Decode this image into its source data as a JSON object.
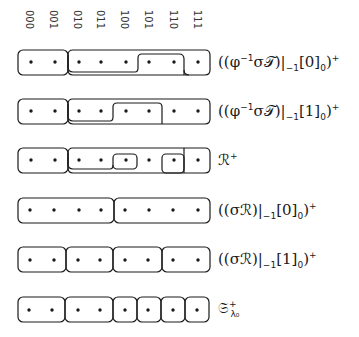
{
  "columns": [
    "000",
    "001",
    "010",
    "011",
    "100",
    "101",
    "110",
    "111"
  ],
  "rows": [
    {
      "label_main": "((φ",
      "label_sup1": "−1",
      "label_mid": "σ𝒯)|",
      "label_sub1": "−1",
      "label_bracket": "[0]",
      "label_sub2": "0",
      "label_end": ")",
      "label_sup2": "+",
      "partition": "{000,001} {010,011,100,101,110} {101,110}⊂ {111}",
      "description": "Outer blocks: [000-001], [010-110] with nested [101-110], [111]"
    },
    {
      "label_main": "((φ",
      "label_sup1": "−1",
      "label_mid": "σ𝒯)|",
      "label_sub1": "−1",
      "label_bracket": "[1]",
      "label_sub2": "0",
      "label_end": ")",
      "label_sup2": "+",
      "description": "Outer blocks: [000-001], [010-101] with nested [100-101], [110-111]"
    },
    {
      "label_main": "ℛ",
      "label_sup2": "+",
      "description": "Blocks: [000-001], [010-111] containing nested [100], [101], [110], [111]"
    },
    {
      "label_main": "((σℛ)|",
      "label_sub1": "−1",
      "label_bracket": "[0]",
      "label_sub2": "0",
      "label_end": ")",
      "label_sup2": "+",
      "description": "Blocks: [000-011], [100-111]"
    },
    {
      "label_main": "((σℛ)|",
      "label_sub1": "−1",
      "label_bracket": "[1]",
      "label_sub2": "0",
      "label_end": ")",
      "label_sup2": "+",
      "description": "Blocks: [000-001], [010-011], [100-101], [110-111]"
    },
    {
      "label_main": "𝔖",
      "label_sub1": "λ₀",
      "label_sup2": "+",
      "description": "Blocks: [000-001], [010-011], [100], [101], [110], [111]"
    }
  ]
}
